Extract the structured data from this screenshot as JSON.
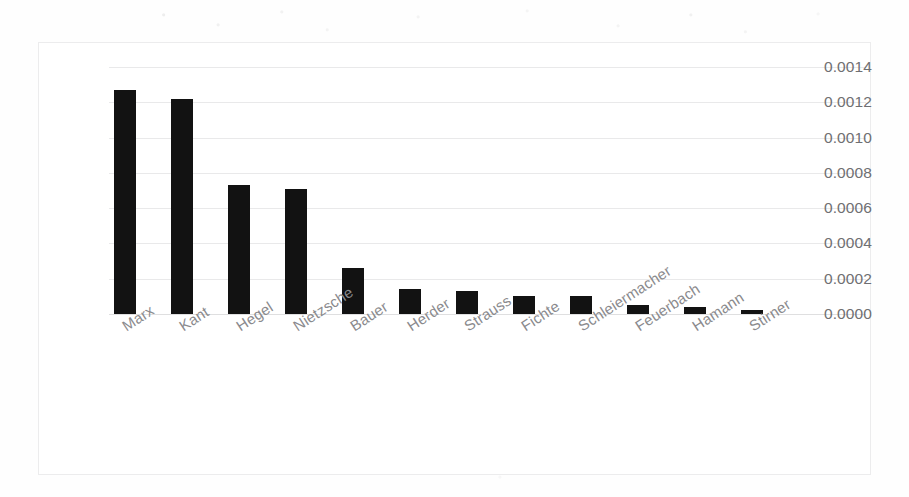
{
  "chart_data": {
    "type": "bar",
    "title": "",
    "subtitle": "",
    "xlabel": "",
    "ylabel": "",
    "categories": [
      "Marx",
      "Kant",
      "Hegel",
      "Nietzsche",
      "Bauer",
      "Herder",
      "Strauss",
      "Fichte",
      "Schleiermacher",
      "Feuerbach",
      "Hamann",
      "Stirner"
    ],
    "values": [
      0.00127,
      0.00122,
      0.00073,
      0.00071,
      0.00026,
      0.00014,
      0.00013,
      0.0001,
      0.0001,
      5e-05,
      4e-05,
      2e-05
    ],
    "ylim": [
      0.0,
      0.0014
    ],
    "ytick_labels": [
      "0.0014",
      "0.0012",
      "0.0010",
      "0.0008",
      "0.0006",
      "0.0004",
      "0.0002",
      "0.0000"
    ],
    "ytick_values": [
      0.0014,
      0.0012,
      0.001,
      0.0008,
      0.0006,
      0.0004,
      0.0002,
      0.0
    ],
    "grid": true,
    "legend": "none",
    "bar_color": "#121212",
    "grid_color": "#e9e9ea",
    "axis_text_color": "#6f6f72",
    "category_text_color": "#8a8a8d",
    "xtick_rotation_deg": -33
  }
}
